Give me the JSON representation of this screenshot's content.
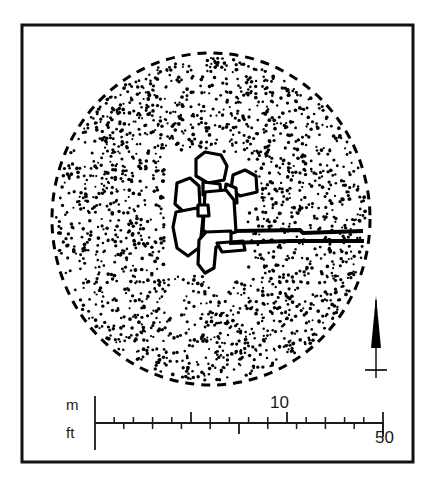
{
  "figure": {
    "kind": "archaeological-site-plan",
    "title": "",
    "background_color": "#ffffff",
    "ink_color": "#000000",
    "frame": {
      "name": "border-frame",
      "x": 22,
      "y": 25,
      "width": 391,
      "height": 437,
      "stroke_color": "#111111",
      "stroke_width": 3
    }
  },
  "site": {
    "mound": {
      "name": "stippled-mound",
      "boundary_style": "dashed",
      "fill_style": "stipple",
      "center_x": 211,
      "center_y": 219,
      "radius_x": 159,
      "radius_y": 166,
      "dot_color": "#000000",
      "dash_color": "#000000"
    },
    "structures_note": "cluster of rectilinear room outlines at mound centre",
    "wall_lines": [
      {
        "name": "upper-wall-line",
        "from_x": 236,
        "from_y": 232,
        "to_x": 361,
        "to_y": 230
      },
      {
        "name": "lower-wall-line",
        "from_x": 231,
        "from_y": 243,
        "to_x": 362,
        "to_y": 241
      }
    ]
  },
  "north_arrow": {
    "name": "north-arrow",
    "x": 376,
    "top_y": 296,
    "bottom_y": 378,
    "crossbar_y": 370,
    "crossbar_half_width": 11,
    "color": "#000000"
  },
  "scale_bar": {
    "name": "scale-bar",
    "baseline_y": 423,
    "start_x": 95,
    "end_x": 383,
    "metric": {
      "unit_label": "m",
      "max_value": 15,
      "labeled_value": "10",
      "labeled_value_x": 282,
      "tick_side": "above",
      "tick_count": 15,
      "major_every": 5
    },
    "imperial": {
      "unit_label": "ft",
      "max_value": 50,
      "labeled_value": "50",
      "labeled_value_x": 383,
      "tick_side": "below",
      "tick_count": 10,
      "major_every": 5
    }
  },
  "labels": {
    "meters": "m",
    "feet": "ft",
    "meters_tick": "10",
    "feet_tick": "50"
  }
}
